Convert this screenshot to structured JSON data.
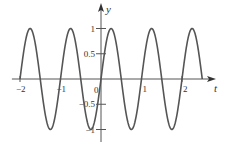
{
  "chart_data": {
    "type": "line",
    "title": "",
    "xlabel": "t",
    "ylabel": "y",
    "function": "y = sin(2πt)",
    "x_range": [
      -2,
      2.5
    ],
    "xlim": [
      -2.2,
      2.8
    ],
    "ylim": [
      -1.3,
      1.5
    ],
    "x_ticks": [
      -2,
      -1,
      0,
      1,
      2
    ],
    "x_tick_labels": [
      "−2",
      "−1",
      "0",
      "1",
      "2"
    ],
    "y_ticks": [
      -1,
      -0.5,
      0.5,
      1
    ],
    "y_tick_labels": [
      "−1",
      "−0.5",
      "0.5",
      "1"
    ],
    "grid": false,
    "legend": null,
    "series": [
      {
        "name": "sin(2πt)",
        "color": "#555555",
        "x": [
          -2,
          -1.75,
          -1.5,
          -1.25,
          -1,
          -0.75,
          -0.5,
          -0.25,
          0,
          0.25,
          0.5,
          0.75,
          1,
          1.25,
          1.5,
          1.75,
          2,
          2.25,
          2.5
        ],
        "values": [
          0,
          1,
          0,
          -1,
          0,
          1,
          0,
          -1,
          0,
          1,
          0,
          -1,
          0,
          1,
          0,
          -1,
          0,
          1,
          0
        ]
      }
    ]
  },
  "axes": {
    "x_label": "t",
    "y_label": "y",
    "origin_label": "0"
  }
}
